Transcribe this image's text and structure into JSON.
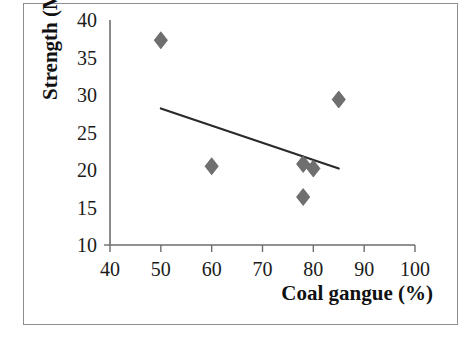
{
  "figure": {
    "background_color": "#ffffff",
    "frame_color": "#8d8d8d",
    "marker_color": "#6f6f6f",
    "trendline_color": "#2a2a2a",
    "axis_color": "#6d6d6d"
  },
  "chart_data": {
    "type": "scatter",
    "title": "",
    "xlabel": "Coal gangue (%)",
    "ylabel": "Strength (MPa)",
    "xlim": [
      40,
      100
    ],
    "ylim": [
      10,
      40
    ],
    "xticks": [
      40,
      50,
      60,
      70,
      80,
      90,
      100
    ],
    "yticks": [
      10,
      15,
      20,
      25,
      30,
      35,
      40
    ],
    "xtick_labels": [
      "40",
      "50",
      "60",
      "70",
      "80",
      "90",
      "100"
    ],
    "ytick_labels": [
      "10",
      "15",
      "20",
      "25",
      "30",
      "35",
      "40"
    ],
    "grid": false,
    "legend": false,
    "legend_position": "none",
    "marker_shape": "diamond",
    "series": [
      {
        "name": "Strength vs coal gangue",
        "points": [
          {
            "x": 50,
            "y": 37.3
          },
          {
            "x": 60,
            "y": 20.5
          },
          {
            "x": 78,
            "y": 20.8
          },
          {
            "x": 80,
            "y": 20.2
          },
          {
            "x": 78,
            "y": 16.4
          },
          {
            "x": 85,
            "y": 29.4
          }
        ]
      }
    ],
    "trendline": {
      "type": "linear",
      "x_start": 50,
      "y_start": 28.2,
      "x_end": 85,
      "y_end": 20.2
    }
  }
}
